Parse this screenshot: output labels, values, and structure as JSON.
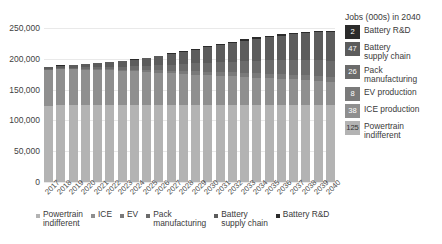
{
  "chart_data": {
    "type": "bar",
    "stacked": true,
    "title": "",
    "subtitle": "",
    "xlabel": "",
    "ylabel": "",
    "ylim": [
      0,
      250000
    ],
    "ytick_values": [
      250000,
      200000,
      150000,
      100000,
      50000,
      0
    ],
    "ytick_labels": [
      "250,000",
      "200,000",
      "150,000",
      "100,000",
      "50,000",
      "0"
    ],
    "grid": true,
    "legend_position": "right and bottom",
    "categories": [
      "2017",
      "2018",
      "2019",
      "2020",
      "2021",
      "2022",
      "2023",
      "2024",
      "2025",
      "2026",
      "2027",
      "2028",
      "2029",
      "2030",
      "2031",
      "2032",
      "2033",
      "2034",
      "2035",
      "2036",
      "2037",
      "2038",
      "2039",
      "2040"
    ],
    "series": [
      {
        "name": "Powertrain indifferent",
        "color": "#b3b3b3",
        "values": [
          124000,
          124500,
          124500,
          124500,
          124500,
          124800,
          124800,
          125000,
          125000,
          125000,
          125000,
          125000,
          125000,
          125000,
          125000,
          125000,
          125000,
          125000,
          125000,
          125000,
          125000,
          125000,
          125000,
          125000
        ]
      },
      {
        "name": "ICE",
        "color": "#8f8f8f",
        "values": [
          58000,
          58500,
          58300,
          58000,
          57500,
          56500,
          55500,
          54500,
          53500,
          52500,
          51500,
          50500,
          49500,
          48500,
          47500,
          46500,
          45500,
          44500,
          43500,
          42500,
          41500,
          40500,
          39500,
          38000
        ]
      },
      {
        "name": "EV",
        "color": "#7a7a7a",
        "values": [
          500,
          700,
          900,
          1100,
          1400,
          1800,
          2200,
          2700,
          3200,
          3700,
          4200,
          4700,
          5200,
          5600,
          6000,
          6300,
          6600,
          6900,
          7100,
          7300,
          7500,
          7700,
          7900,
          8000
        ]
      },
      {
        "name": "Pack manufacturing",
        "color": "#6b6b6b",
        "values": [
          1200,
          1600,
          2000,
          2500,
          3100,
          3900,
          4800,
          5800,
          7000,
          8400,
          9800,
          11300,
          12900,
          14500,
          16100,
          17700,
          19200,
          20600,
          21800,
          22900,
          23900,
          24800,
          25500,
          26000
        ]
      },
      {
        "name": "Battery supply chain",
        "color": "#5c5c5c",
        "values": [
          3000,
          3600,
          4200,
          5000,
          6000,
          7300,
          8800,
          10500,
          12500,
          14800,
          17200,
          19800,
          22500,
          25300,
          28000,
          30700,
          33300,
          35800,
          38100,
          40200,
          42100,
          43800,
          45500,
          47000
        ]
      },
      {
        "name": "Battery R&D",
        "color": "#2b2b2b",
        "values": [
          300,
          350,
          400,
          450,
          520,
          600,
          700,
          800,
          900,
          1000,
          1100,
          1250,
          1400,
          1550,
          1700,
          1800,
          1900,
          1950,
          2000,
          2000,
          2000,
          2000,
          2000,
          2000
        ]
      }
    ],
    "totals": [
      187000,
      189250,
      190300,
      191550,
      193020,
      194900,
      196800,
      199300,
      202100,
      205400,
      208800,
      212550,
      216500,
      220450,
      224300,
      227000,
      231500,
      234750,
      237500,
      239900,
      242000,
      243800,
      245400,
      246000
    ]
  },
  "right_legend": {
    "title": "Jobs (000s) in 2040",
    "items": [
      {
        "value": "2",
        "label": "Battery R&D",
        "color": "#2b2b2b",
        "text_color": "#ffffff"
      },
      {
        "value": "47",
        "label": "Battery\nsupply chain",
        "color": "#5c5c5c",
        "text_color": "#ffffff"
      },
      {
        "value": "26",
        "label": "Pack\nmanufacturing",
        "color": "#6b6b6b",
        "text_color": "#ffffff"
      },
      {
        "value": "8",
        "label": "EV production",
        "color": "#7a7a7a",
        "text_color": "#ffffff"
      },
      {
        "value": "38",
        "label": "ICE production",
        "color": "#8f8f8f",
        "text_color": "#ffffff"
      },
      {
        "value": "125",
        "label": "Powertrain\nindifferent",
        "color": "#b3b3b3",
        "text_color": "#333333"
      }
    ]
  },
  "bottom_legend": {
    "items": [
      {
        "label": "Powertrain\nindifferent",
        "color": "#b3b3b3"
      },
      {
        "label": "ICE",
        "color": "#8f8f8f"
      },
      {
        "label": "EV",
        "color": "#7a7a7a"
      },
      {
        "label": "Pack\nmanufacturing",
        "color": "#6b6b6b"
      },
      {
        "label": "Battery\nsupply chain",
        "color": "#5c5c5c"
      },
      {
        "label": "Battery R&D",
        "color": "#2b2b2b"
      }
    ]
  }
}
